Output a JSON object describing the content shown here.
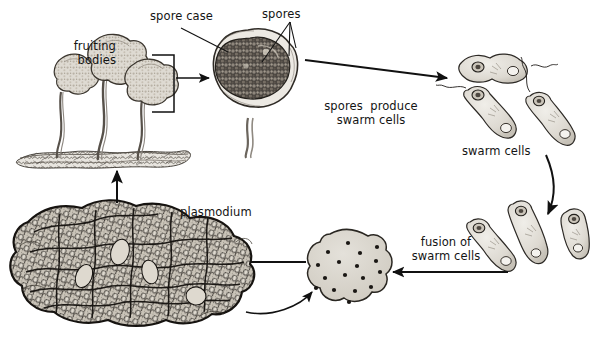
{
  "figure": {
    "background_color": "#ffffff",
    "ink_color": "#141414",
    "canvas": {
      "width": 604,
      "height": 346
    }
  },
  "labels": {
    "fruiting_bodies": "fruiting\nbodies",
    "spore_case": "spore case",
    "spores": "spores",
    "spores_produce_swarm_cells": "spores  produce\nswarm cells",
    "swarm_cells": "swarm cells",
    "fusion_of_swarm_cells": "fusion of\nswarm cells",
    "plasmodium": "plasmodium"
  },
  "stages": [
    {
      "name": "fruiting-bodies",
      "label": "fruiting bodies",
      "count": 3,
      "description": "Three stalked sporangia rising from soil"
    },
    {
      "name": "spore-case",
      "label": "spore case",
      "description": "Round sporangium filled with dark spores on a stalk"
    },
    {
      "name": "swarm-cells",
      "label": "swarm cells",
      "count": 3,
      "description": "Flagellated elongated swarm cells"
    },
    {
      "name": "fusing-swarm-cells",
      "label": "fusion of swarm cells",
      "count": 3,
      "description": "Swarm cells fusing in pairs"
    },
    {
      "name": "zygote-blob",
      "label": "zygote",
      "nuclei_count": 17,
      "description": "Lobed multinucleate amoeboid mass"
    },
    {
      "name": "plasmodium",
      "label": "plasmodium",
      "description": "Large reticulate multinucleate plasmodium"
    }
  ],
  "arrows": [
    {
      "name": "arrow-fruiting-to-spore-case",
      "from": "fruiting-bodies",
      "to": "spore-case",
      "direction": "right"
    },
    {
      "name": "arrow-spore-case-to-swarm-cells",
      "from": "spore-case",
      "to": "swarm-cells",
      "direction": "right-down"
    },
    {
      "name": "arrow-swarm-cells-to-fusion",
      "from": "swarm-cells",
      "to": "fusing-swarm-cells",
      "direction": "down"
    },
    {
      "name": "arrow-fusion-to-zygote",
      "from": "fusing-swarm-cells",
      "to": "zygote-blob",
      "direction": "left"
    },
    {
      "name": "arrow-zygote-to-plasmodium",
      "from": "zygote-blob",
      "to": "plasmodium",
      "direction": "left"
    },
    {
      "name": "arrow-plasmodium-to-zygote-curve",
      "from": "plasmodium",
      "to": "zygote-blob",
      "direction": "curve-right"
    },
    {
      "name": "arrow-plasmodium-to-fruiting",
      "from": "plasmodium",
      "to": "fruiting-bodies",
      "direction": "up"
    }
  ],
  "leaders": [
    {
      "name": "leader-spore-case",
      "label": "spore case"
    },
    {
      "name": "leader-spores",
      "label": "spores"
    }
  ]
}
